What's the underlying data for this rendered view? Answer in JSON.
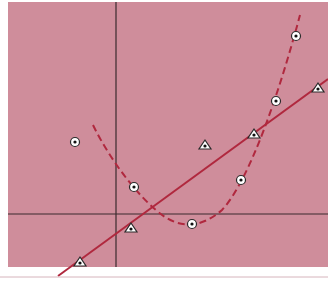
{
  "figure": {
    "background": "#cf8d9b",
    "axis_color": "#3a2a2e",
    "series_color": "#b0283e",
    "marker_fill": "#ffffff",
    "marker_stroke": "#2a2a2a"
  },
  "chart_data": {
    "type": "scatter",
    "title": "",
    "xlabel": "",
    "ylabel": "",
    "grid": false,
    "legend": null,
    "axes": {
      "x_axis_visible": true,
      "y_axis_visible": true,
      "tick_labels": []
    },
    "series": [
      {
        "name": "circles (quadratic fit, dashed)",
        "marker": "circle-dot",
        "line": "dashed curve",
        "points_px": [
          [
            75,
            142
          ],
          [
            134,
            187
          ],
          [
            192,
            224
          ],
          [
            241,
            180
          ],
          [
            276,
            101
          ],
          [
            296,
            36
          ]
        ]
      },
      {
        "name": "triangles (linear fit, solid)",
        "marker": "triangle-dot",
        "line": "solid straight",
        "points_px": [
          [
            80,
            262
          ],
          [
            131,
            228
          ],
          [
            205,
            145
          ],
          [
            254,
            134
          ],
          [
            318,
            88
          ]
        ]
      }
    ]
  }
}
